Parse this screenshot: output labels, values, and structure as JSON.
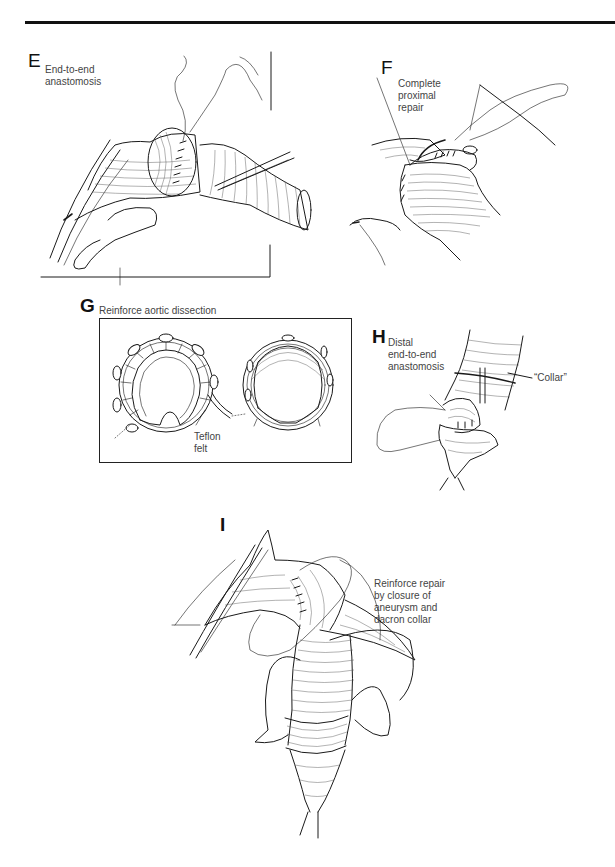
{
  "page": {
    "background": "#ffffff",
    "rule_color": "#111111"
  },
  "panels": {
    "E": {
      "letter": "E",
      "caption": "End-to-end\nanastomosis"
    },
    "F": {
      "letter": "F",
      "caption": "Complete\nproximal\nrepair"
    },
    "G": {
      "letter": "G",
      "caption": "Reinforce aortic dissection",
      "label_teflon": "Teflon\nfelt"
    },
    "H": {
      "letter": "H",
      "caption": "Distal\nend-to-end\nanastomosis",
      "label_collar": "“Collar”"
    },
    "I": {
      "letter": "I",
      "caption": "Reinforce repair\nby closure of\naneurysm and\ndacron collar"
    }
  }
}
